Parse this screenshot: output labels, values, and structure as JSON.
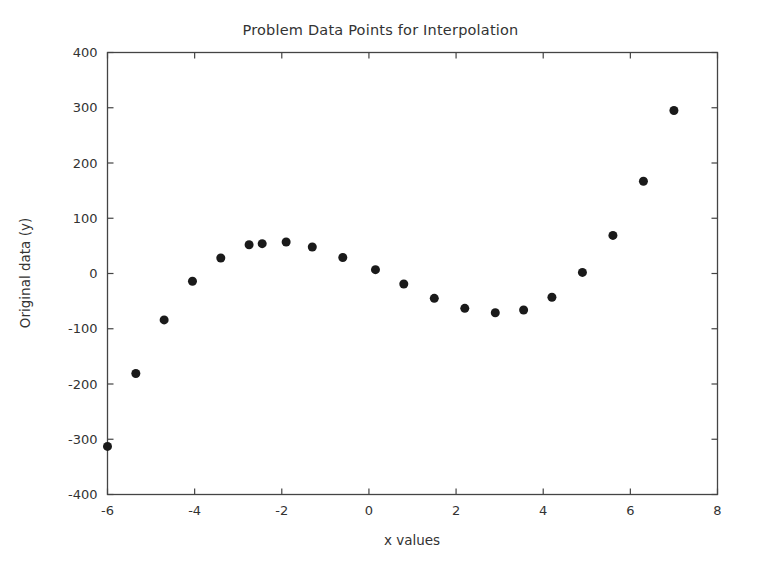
{
  "chart_data": {
    "type": "scatter",
    "title": "Problem Data Points for Interpolation",
    "xlabel": "x values",
    "ylabel": "Original data (y)",
    "xlim": [
      -6,
      8
    ],
    "ylim": [
      -400,
      400
    ],
    "xticks": [
      -6,
      -4,
      -2,
      0,
      2,
      4,
      6,
      8
    ],
    "xtick_labels": [
      "-6",
      "-4",
      "-2",
      "0",
      "2",
      "4",
      "6",
      "8"
    ],
    "yticks": [
      -400,
      -300,
      -200,
      -100,
      0,
      100,
      200,
      300,
      400
    ],
    "ytick_labels": [
      "-400",
      "-300",
      "-200",
      "-100",
      "0",
      "100",
      "200",
      "300",
      "400"
    ],
    "grid": false,
    "legend": null,
    "marker": "circle",
    "marker_color": "#1a1a1a",
    "marker_size": 6,
    "point_count": 21,
    "x": [
      -6.0,
      -5.35,
      -4.7,
      -4.05,
      -3.4,
      -2.75,
      -2.1,
      -1.45,
      -0.8,
      -0.15,
      0.5,
      1.15,
      1.8,
      2.45,
      3.1,
      3.75,
      4.4,
      5.05,
      5.7,
      6.35,
      7.0
    ],
    "y": [
      -313,
      -181,
      -84,
      -14,
      28,
      52,
      57,
      48,
      29,
      7,
      -19,
      -45,
      -62,
      -71,
      -65,
      -43,
      2,
      69,
      167,
      295,
      295
    ],
    "points": [
      {
        "x": -6.0,
        "y": -313
      },
      {
        "x": -5.35,
        "y": -181
      },
      {
        "x": -4.7,
        "y": -84
      },
      {
        "x": -4.05,
        "y": -14
      },
      {
        "x": -3.4,
        "y": 28
      },
      {
        "x": -2.75,
        "y": 52
      },
      {
        "x": -2.45,
        "y": 54
      },
      {
        "x": -1.9,
        "y": 57
      },
      {
        "x": -1.3,
        "y": 48
      },
      {
        "x": -0.6,
        "y": 29
      },
      {
        "x": 0.15,
        "y": 7
      },
      {
        "x": 0.8,
        "y": -19
      },
      {
        "x": 1.5,
        "y": -45
      },
      {
        "x": 2.2,
        "y": -63
      },
      {
        "x": 2.9,
        "y": -71
      },
      {
        "x": 3.55,
        "y": -66
      },
      {
        "x": 4.2,
        "y": -43
      },
      {
        "x": 4.9,
        "y": 2
      },
      {
        "x": 5.6,
        "y": 69
      },
      {
        "x": 6.3,
        "y": 167
      },
      {
        "x": 7.0,
        "y": 295
      }
    ]
  },
  "axes": {
    "x_axis_name": "x-axis",
    "y_axis_name": "y-axis"
  }
}
